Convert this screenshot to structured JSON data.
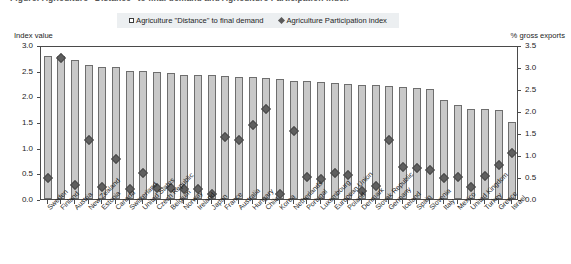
{
  "title_partial": "Figure: Agriculture \"Distance\" to final demand and Agriculture Participation index",
  "legend": {
    "items": [
      {
        "label": "Agriculture \"Distance\" to final demand",
        "marker": "open-square-icon",
        "color": "#c8c8c8"
      },
      {
        "label": "Agriculture Participation index",
        "marker": "filled-diamond-icon",
        "color": "#5f5f5f"
      }
    ]
  },
  "axes": {
    "left_caption": "Index value",
    "right_caption": "% gross exports",
    "left_ticks": [
      "0.0",
      "0.5",
      "1.0",
      "1.5",
      "2.0",
      "2.5",
      "3.0"
    ],
    "right_ticks": [
      "0.0",
      "0.5",
      "1.0",
      "1.5",
      "2.0",
      "2.5",
      "3.0",
      "3.5"
    ]
  },
  "chart_data": {
    "type": "bar",
    "title": "Agriculture \"Distance\" to final demand and Agriculture Participation index",
    "xlabel": "",
    "ylabel": "Index value",
    "y2label": "% gross exports",
    "ylim": [
      0,
      3.0
    ],
    "y2lim": [
      0,
      3.5
    ],
    "grid": false,
    "legend_position": "top-center",
    "categories": [
      "Sweden",
      "Finland",
      "Austria",
      "New Zealand",
      "Estonia",
      "Canada",
      "Switzerland",
      "United States",
      "Czech Republic",
      "Belgium",
      "Norway",
      "Ireland",
      "Japan",
      "France",
      "Australia",
      "Hungary",
      "Chile",
      "Korea",
      "Netherlands",
      "Portugal",
      "Luxembourg",
      "European Union",
      "Poland",
      "Denmark",
      "Slovak Republic",
      "Germany",
      "Iceland",
      "Spain",
      "Slovenia",
      "Italy",
      "Mexico",
      "United Kingdom",
      "Turkey",
      "Greece",
      "Israel"
    ],
    "series": [
      {
        "name": "Agriculture \"Distance\" to final demand",
        "axis": "left",
        "type": "bar",
        "values": [
          2.78,
          2.78,
          2.7,
          2.62,
          2.58,
          2.58,
          2.5,
          2.5,
          2.48,
          2.45,
          2.42,
          2.42,
          2.42,
          2.4,
          2.38,
          2.38,
          2.36,
          2.34,
          2.3,
          2.3,
          2.28,
          2.26,
          2.24,
          2.22,
          2.22,
          2.2,
          2.18,
          2.16,
          2.14,
          1.92,
          1.84,
          1.76,
          1.76,
          1.74,
          1.5
        ]
      },
      {
        "name": "Agriculture Participation index",
        "axis": "right",
        "type": "scatter",
        "values": [
          0.48,
          3.2,
          0.32,
          1.35,
          0.28,
          0.9,
          0.22,
          0.58,
          0.25,
          0.25,
          0.22,
          0.22,
          0.12,
          1.4,
          1.35,
          1.68,
          2.05,
          0.12,
          1.55,
          0.5,
          0.45,
          0.6,
          0.55,
          0.18,
          0.3,
          1.35,
          0.72,
          0.7,
          0.65,
          0.48,
          0.5,
          0.28,
          0.52,
          0.78,
          1.05
        ]
      }
    ]
  }
}
